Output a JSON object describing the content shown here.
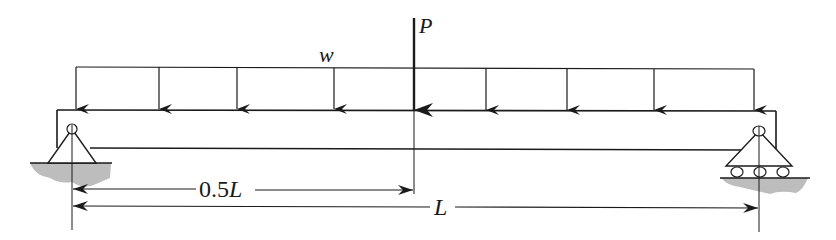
{
  "diagram": {
    "labels": {
      "distributed_load": "w",
      "point_load": "P",
      "half_span_prefix": "0.5",
      "half_span_var": "L",
      "span": "L"
    },
    "supports": {
      "left": "pin-support",
      "right": "roller-support"
    },
    "colors": {
      "line": "#1a1a1a",
      "ground": "#bdbdbd"
    }
  }
}
